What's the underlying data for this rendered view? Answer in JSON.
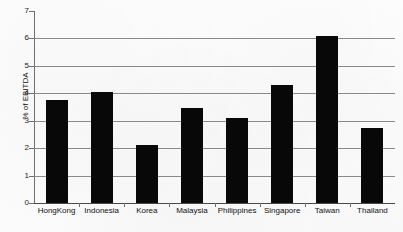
{
  "chart_data": {
    "type": "bar",
    "title": "",
    "subtitle": "",
    "xlabel": "",
    "ylabel": "% of EBITDA",
    "ylim": [
      0,
      7
    ],
    "yticks": [
      0,
      1,
      2,
      3,
      4,
      5,
      6,
      7
    ],
    "ytick_labels": [
      "0",
      "1",
      "2",
      "3",
      "4",
      "5",
      "6",
      "7"
    ],
    "grid": true,
    "legend": false,
    "legend_position": "none",
    "bar_color": "#080808",
    "gridline_color": "#8a8a8a",
    "axis_color": "#6f6f6f",
    "categories": [
      "HongKong",
      "Indonesia",
      "Korea",
      "Malaysia",
      "Philippines",
      "Singapore",
      "Taiwan",
      "Thailand"
    ],
    "values": [
      3.75,
      4.05,
      2.1,
      3.45,
      3.1,
      4.3,
      6.1,
      2.75
    ],
    "series": [
      {
        "name": "% of EBITDA",
        "values": [
          3.75,
          4.05,
          2.1,
          3.45,
          3.1,
          4.3,
          6.1,
          2.75
        ]
      }
    ]
  }
}
